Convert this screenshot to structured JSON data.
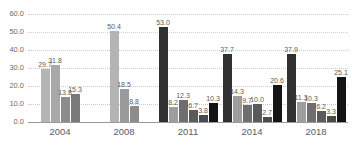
{
  "watermark": "",
  "chart_data": {
    "type": "bar",
    "title": "",
    "subtitle": "",
    "xlabel": "",
    "ylabel": "",
    "ylim": [
      0.0,
      60.0
    ],
    "yticks": [
      "0.0",
      "10.0",
      "20.0",
      "30.0",
      "40.0",
      "50.0",
      "60.0"
    ],
    "ytick_values": [
      0.0,
      10.0,
      20.0,
      30.0,
      40.0,
      50.0,
      60.0
    ],
    "grid": true,
    "grid_style": "dotted-horizontal",
    "legend": "none",
    "data_labels": true,
    "categories": [
      "2004",
      "2008",
      "2011",
      "2014",
      "2018"
    ],
    "groups": [
      {
        "category": "2004",
        "bars": [
          {
            "value": 29.7,
            "label": "29.7",
            "color": "#b4b4b4"
          },
          {
            "value": 31.8,
            "label": "31.8",
            "color": "#a8a8a8"
          },
          {
            "value": 13.8,
            "label": "13.8",
            "color": "#8c8c8c"
          },
          {
            "value": 15.3,
            "label": "15.3",
            "color": "#7a7a7a"
          }
        ]
      },
      {
        "category": "2008",
        "bars": [
          {
            "value": 50.4,
            "label": "50.4",
            "color": "#b4b4b4"
          },
          {
            "value": 18.5,
            "label": "18.5",
            "color": "#9a9a9a"
          },
          {
            "value": 8.8,
            "label": "8.8",
            "color": "#8c8c8c"
          }
        ]
      },
      {
        "category": "2011",
        "bars": [
          {
            "value": 53.0,
            "label": "53.0",
            "color": "#303030"
          },
          {
            "value": 8.2,
            "label": "8.2",
            "color": "#9e9e9e"
          },
          {
            "value": 12.3,
            "label": "12.3",
            "color": "#6e6e6e"
          },
          {
            "value": 6.7,
            "label": "6.7",
            "color": "#5a5a5a"
          },
          {
            "value": 3.8,
            "label": "3.8",
            "color": "#4a4a4a"
          },
          {
            "value": 10.3,
            "label": "10.3",
            "color": "#141414"
          }
        ]
      },
      {
        "category": "2014",
        "bars": [
          {
            "value": 37.7,
            "label": "37.7",
            "color": "#303030"
          },
          {
            "value": 14.3,
            "label": "14.3",
            "color": "#9e9e9e"
          },
          {
            "value": 9.7,
            "label": "9.7",
            "color": "#6e6e6e"
          },
          {
            "value": 10.0,
            "label": "10.0",
            "color": "#5a5a5a"
          },
          {
            "value": 2.7,
            "label": "2.7",
            "color": "#4a4a4a"
          },
          {
            "value": 20.6,
            "label": "20.6",
            "color": "#141414"
          }
        ]
      },
      {
        "category": "2018",
        "bars": [
          {
            "value": 37.9,
            "label": "37.9",
            "color": "#303030"
          },
          {
            "value": 11.3,
            "label": "11.3",
            "color": "#9e9e9e"
          },
          {
            "value": 10.3,
            "label": "10.3",
            "color": "#6e6e6e"
          },
          {
            "value": 6.2,
            "label": "6.2",
            "color": "#5a5a5a"
          },
          {
            "value": 3.3,
            "label": "3.3",
            "color": "#4a4a4a"
          },
          {
            "value": 25.1,
            "label": "25.1",
            "color": "#141414"
          }
        ]
      }
    ]
  }
}
